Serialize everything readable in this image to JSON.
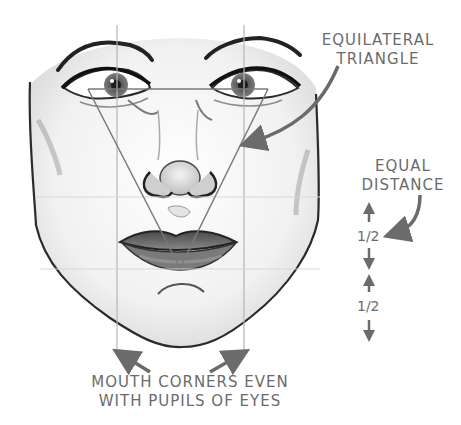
{
  "illustration": {
    "subject": "face-proportions-guide",
    "colors": {
      "ink": "#2b2b2b",
      "annotation": "#6b6b6b",
      "guide_line": "#b5b5b5",
      "triangle_line": "#7a7a7a",
      "skin_shadow": "#d6d6d6",
      "lip": "#5a5a5a"
    }
  },
  "annotations": {
    "triangle": {
      "line1": "EQUILATERAL",
      "line2": "TRIANGLE"
    },
    "distance": {
      "line1": "EQUAL",
      "line2": "DISTANCE",
      "upper_half": "1/2",
      "lower_half": "1/2"
    },
    "mouth": {
      "line1": "MOUTH CORNERS EVEN",
      "line2": "WITH PUPILS OF EYES"
    }
  }
}
